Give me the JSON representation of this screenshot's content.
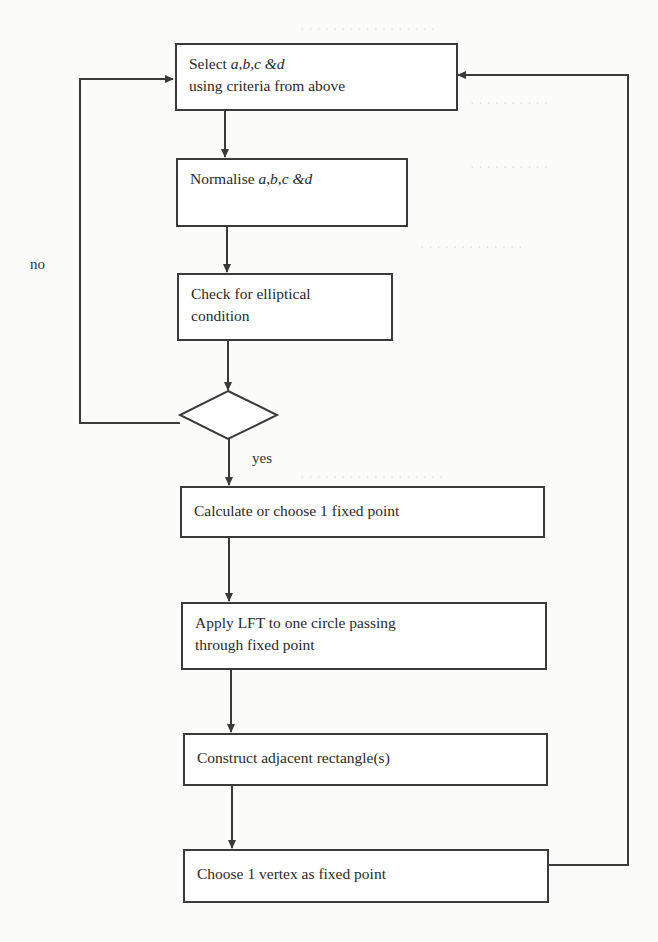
{
  "flowchart": {
    "steps": [
      {
        "id": "select",
        "line1_prefix": "Select ",
        "line1_italic": "a,b,c &d",
        "line2": "using criteria from above"
      },
      {
        "id": "normalise",
        "prefix": "Normalise ",
        "italic": "a,b,c &d"
      },
      {
        "id": "check",
        "line1": "Check for elliptical",
        "line2": "condition"
      },
      {
        "id": "calculate",
        "text": "Calculate or choose 1 fixed point"
      },
      {
        "id": "apply-lft",
        "line1": "Apply LFT to one circle passing",
        "line2": "through fixed point"
      },
      {
        "id": "construct",
        "text": "Construct adjacent rectangle(s)"
      },
      {
        "id": "choose-vertex",
        "text": "Choose 1 vertex as fixed point"
      }
    ],
    "decision": {
      "yes_label": "yes",
      "no_label": "no"
    }
  },
  "colors": {
    "line": "#3a3a3a",
    "page": "#fbfbf9"
  }
}
